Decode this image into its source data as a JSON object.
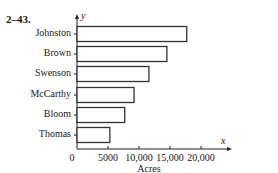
{
  "problem_number": "2–43.",
  "chart_data": {
    "type": "bar",
    "orientation": "horizontal",
    "title": "",
    "categories": [
      "Johnston",
      "Brown",
      "Swenson",
      "McCarthy",
      "Bloom",
      "Thomas"
    ],
    "values": [
      17700,
      14500,
      11600,
      9200,
      7700,
      5300
    ],
    "xlabel": "Acres",
    "ylabel": "",
    "x_axis_symbol": "x",
    "y_axis_symbol": "y",
    "x_ticks": [
      "0",
      "5000",
      "10,000",
      "15,000",
      "20,000"
    ],
    "x_tick_values": [
      0,
      5000,
      10000,
      15000,
      20000
    ],
    "xlim": [
      0,
      22000
    ],
    "grid": false,
    "legend": "none",
    "bar_fill": "#ffffff",
    "bar_stroke": "#333333"
  }
}
